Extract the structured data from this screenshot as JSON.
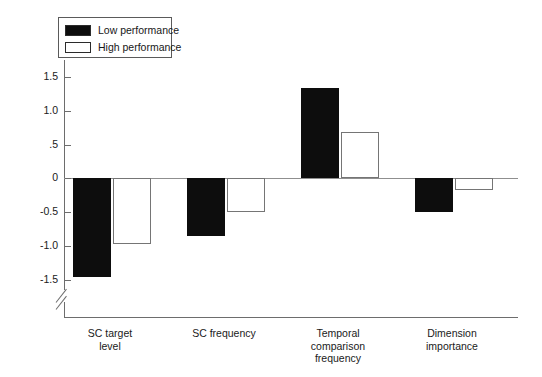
{
  "chart_data": {
    "type": "bar",
    "title": "",
    "subtitle": "",
    "xlabel": "",
    "ylabel": "",
    "categories": [
      "SC target level",
      "SC frequency",
      "Temporal comparison frequency",
      "Dimension importance"
    ],
    "category_lines": [
      [
        "SC target",
        "level"
      ],
      [
        "SC frequency"
      ],
      [
        "Temporal",
        "comparison",
        "frequency"
      ],
      [
        "Dimension",
        "importance"
      ]
    ],
    "series": [
      {
        "name": "Low performance",
        "color": "#0d0d0d",
        "values": [
          -1.45,
          -0.85,
          1.33,
          -0.5
        ]
      },
      {
        "name": "High performance",
        "color": "#ffffff",
        "values": [
          -0.97,
          -0.5,
          0.67,
          -0.17
        ]
      }
    ],
    "ylim": [
      -1.5,
      1.5
    ],
    "yticks": [
      1.5,
      1.0,
      0.5,
      0,
      -0.5,
      -1.0,
      -1.5
    ],
    "ytick_labels": [
      "1.5",
      "1.0",
      ".5",
      "0",
      "-0.5",
      "-1.0",
      "-1.5"
    ],
    "grid": false,
    "legend_position": "top-left",
    "axis_break": true,
    "orientation": "vertical"
  },
  "legend": {
    "items": [
      {
        "label": "Low performance",
        "swatch": "filled-black"
      },
      {
        "label": "High performance",
        "swatch": "open-white"
      }
    ]
  }
}
